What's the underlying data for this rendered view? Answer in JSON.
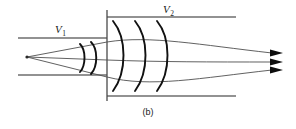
{
  "figure": {
    "caption": "(b)",
    "labels": {
      "v1": {
        "symbol": "V",
        "subscript": "1"
      },
      "v2": {
        "symbol": "V",
        "subscript": "2"
      }
    },
    "colors": {
      "boundary": "#6e6e6e",
      "interface": "#4a4a4a",
      "wavefront": "#111111",
      "ray": "#4f4f4f",
      "arrow": "#0d0d0d",
      "background": "#ffffff"
    }
  },
  "geometry": {
    "interface": {
      "x": 107,
      "y_top": 10,
      "y_bottom": 101
    },
    "focus_point": {
      "x": 27,
      "y": 57
    },
    "boundary_lines": [
      {
        "name": "upper-left",
        "x1": 18,
        "y1": 38,
        "x2": 107,
        "y2": 38
      },
      {
        "name": "lower-left",
        "x1": 18,
        "y1": 75,
        "x2": 107,
        "y2": 75
      },
      {
        "name": "upper-right",
        "x1": 107,
        "y1": 17,
        "x2": 236,
        "y2": 17
      },
      {
        "name": "lower-right",
        "x1": 107,
        "y1": 96,
        "x2": 236,
        "y2": 96
      }
    ],
    "wavefronts_left": [
      {
        "name": "small-arc-1",
        "apex_x": 84
      },
      {
        "name": "small-arc-2",
        "apex_x": 95
      }
    ],
    "wavefronts_right": [
      {
        "name": "arc-1",
        "apex_x": 127
      },
      {
        "name": "arc-2",
        "apex_x": 149
      },
      {
        "name": "arc-3",
        "apex_x": 171
      }
    ],
    "rays": [
      {
        "name": "upper-ray",
        "end_x": 272,
        "end_y": 53
      },
      {
        "name": "axis-ray",
        "end_x": 272,
        "end_y": 62
      },
      {
        "name": "lower-ray",
        "end_x": 272,
        "end_y": 70
      }
    ],
    "arrowheads": [
      {
        "x": 272,
        "y": 53
      },
      {
        "x": 272,
        "y": 62
      },
      {
        "x": 272,
        "y": 70
      }
    ],
    "label_positions": {
      "v1": {
        "x": 55,
        "y": 33
      },
      "v2": {
        "x": 163,
        "y": 13
      },
      "caption": {
        "x": 148,
        "y": 115
      }
    }
  }
}
